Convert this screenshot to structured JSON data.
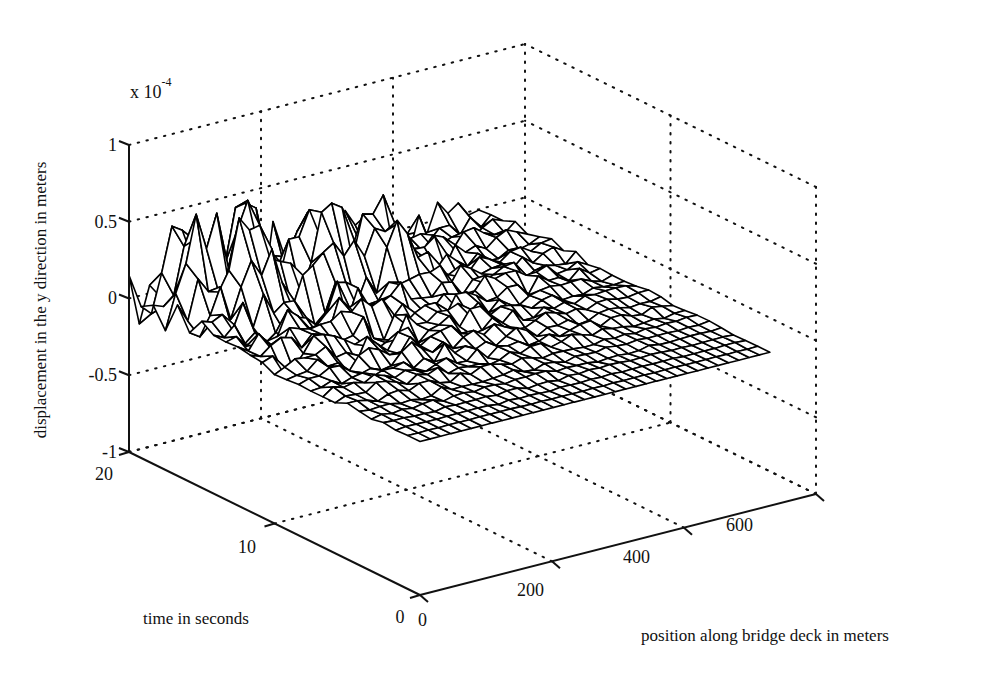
{
  "chart_data": {
    "type": "surface3d",
    "title": "",
    "zlabel": "displacement in the y direction in meters",
    "ylabel": "time in seconds",
    "xlabel": "position along bridge deck in meters",
    "z_multiplier": "x 10",
    "z_exponent": "-4",
    "x_ticks": [
      "0",
      "200",
      "400",
      "600"
    ],
    "x_tick_values": [
      0,
      200,
      400,
      600
    ],
    "y_ticks": [
      "0",
      "10",
      "20"
    ],
    "y_tick_values": [
      0,
      10,
      20
    ],
    "z_ticks": [
      "1",
      "0.5",
      "0",
      "-0.5",
      "-1"
    ],
    "z_tick_values": [
      1,
      0.5,
      0,
      -0.5,
      -1
    ],
    "xlim": [
      0,
      600
    ],
    "ylim": [
      0,
      20
    ],
    "zlim": [
      -1,
      1
    ],
    "grid": true,
    "grid_style": "dotted",
    "surface_style": "wireframe mesh, black edges, white faces",
    "surface_description": "Displacement surface near 0; largest peaks (~0.5 to 0.65 x10^-4) at late times (t ~ 15-20 s) and positions ~50-300 m; amplitude decays toward t = 0 and toward 600 m where the surface is nearly flat at 0.",
    "surface_extent": {
      "x": [
        0,
        530
      ],
      "y": [
        0,
        20
      ]
    },
    "approx_peaks": [
      {
        "x": 60,
        "y": 18,
        "z": 0.62
      },
      {
        "x": 110,
        "y": 17,
        "z": 0.5
      },
      {
        "x": 150,
        "y": 18,
        "z": 0.45
      },
      {
        "x": 230,
        "y": 17,
        "z": 0.58
      },
      {
        "x": 300,
        "y": 16,
        "z": 0.5
      }
    ],
    "mesh": {
      "nx": 34,
      "ny": 24
    }
  }
}
